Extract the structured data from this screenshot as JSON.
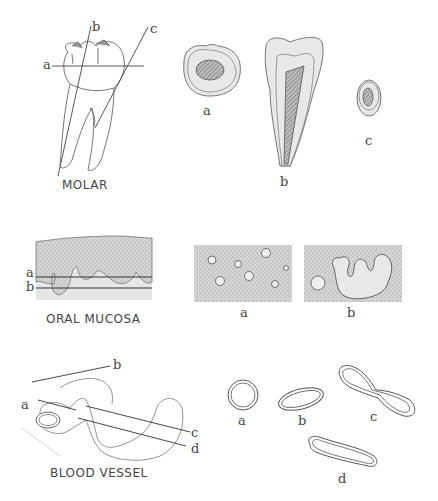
{
  "diagram": {
    "panels": [
      {
        "id": "molar",
        "caption": "MOLAR",
        "plane_labels": [
          "a",
          "b",
          "c"
        ],
        "sections": [
          {
            "label": "a",
            "description": "transverse section of crown"
          },
          {
            "label": "b",
            "description": "longitudinal section"
          },
          {
            "label": "c",
            "description": "oblique section through root"
          }
        ]
      },
      {
        "id": "oral-mucosa",
        "caption": "ORAL  MUCOSA",
        "plane_labels": [
          "a",
          "b"
        ],
        "sections": [
          {
            "label": "a",
            "description": "section showing isolated islands"
          },
          {
            "label": "b",
            "description": "section showing branched profile"
          }
        ]
      },
      {
        "id": "blood-vessel",
        "caption": "BLOOD  VESSEL",
        "plane_labels": [
          "a",
          "b",
          "c",
          "d"
        ],
        "sections": [
          {
            "label": "a",
            "description": "circular profile"
          },
          {
            "label": "b",
            "description": "oval profile"
          },
          {
            "label": "c",
            "description": "dumbbell profile"
          },
          {
            "label": "d",
            "description": "elongated profile"
          }
        ]
      }
    ],
    "colors": {
      "line": "#555555",
      "stipple": "#cfcfcf",
      "light_fill": "#e6e6e6",
      "hatch": "#777777"
    }
  }
}
